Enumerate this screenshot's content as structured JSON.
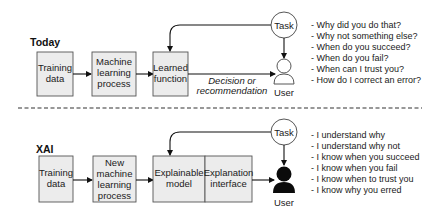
{
  "today": {
    "section_label": "Today",
    "boxes": [
      {
        "lines": [
          "Training",
          "data"
        ]
      },
      {
        "lines": [
          "Machine",
          "learning",
          "process"
        ]
      },
      {
        "lines": [
          "Learned",
          "function"
        ]
      }
    ],
    "edge_label": [
      "Decision or",
      "recommendation"
    ],
    "task_label": "Task",
    "user_label": "User",
    "questions": [
      "- Why did you do that?",
      "- Why not something else?",
      "- When do you succeed?",
      "- When do you fail?",
      "- When can I trust you?",
      "- How do I correct an error?"
    ]
  },
  "xai": {
    "section_label": "XAI",
    "boxes": [
      {
        "lines": [
          "Training",
          "data"
        ]
      },
      {
        "lines": [
          "New",
          "machine",
          "learning",
          "process"
        ]
      },
      {
        "lines": [
          "Explainable",
          "model"
        ]
      },
      {
        "lines": [
          "Explanation",
          "interface"
        ]
      }
    ],
    "task_label": "Task",
    "user_label": "User",
    "statements": [
      "- I understand why",
      "- I understand why not",
      "- I know when you succeed",
      "- I know when you fail",
      "- I know when to trust you",
      "- I know why you erred"
    ]
  }
}
